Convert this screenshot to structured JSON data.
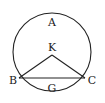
{
  "diagram": {
    "type": "circle-chord-triangle",
    "circle": {
      "cx": 52,
      "cy": 52,
      "r": 39,
      "stroke": "#222222"
    },
    "points": {
      "K": {
        "x": 52,
        "y": 53
      },
      "B": {
        "x": 19,
        "y": 78
      },
      "C": {
        "x": 85,
        "y": 78
      }
    },
    "labels": {
      "A": "A",
      "K": "K",
      "B": "B",
      "C": "C",
      "G": "G"
    },
    "segments": [
      "KB",
      "KC",
      "BC"
    ]
  }
}
